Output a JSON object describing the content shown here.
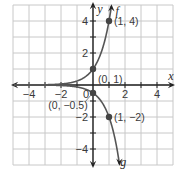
{
  "chart_data": {
    "type": "line",
    "title": "",
    "xlabel": "x",
    "ylabel": "y",
    "xlim": [
      -5,
      5
    ],
    "ylim": [
      -5,
      5
    ],
    "grid": true,
    "x_ticks": [
      -4,
      -2,
      2,
      4
    ],
    "y_ticks": [
      4,
      2,
      -2,
      -4
    ],
    "origin_label": "0",
    "series": [
      {
        "name": "f",
        "equation": "f(x) = 4^x",
        "label_position": [
          1.4,
          4.6
        ],
        "points": [
          {
            "x": 0,
            "y": 1,
            "label": "(0, 1)"
          },
          {
            "x": 1,
            "y": 4,
            "label": "(1, 4)"
          }
        ]
      },
      {
        "name": "g",
        "equation": "g(x) = -0.5 * 4^x",
        "label_position": [
          1.7,
          -4.8
        ],
        "points": [
          {
            "x": 0,
            "y": -0.5,
            "label": "(0, −0.5)"
          },
          {
            "x": 1,
            "y": -2,
            "label": "(1, −2)"
          }
        ]
      }
    ],
    "colors": {
      "curve": "#555555",
      "grid": "#c8c8c8",
      "axis": "#222222",
      "point": "#444444"
    }
  }
}
